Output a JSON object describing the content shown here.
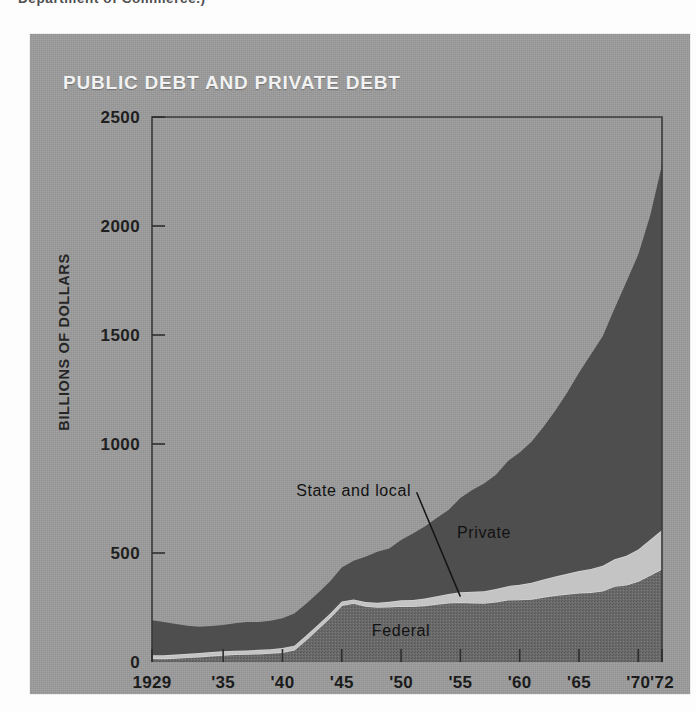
{
  "page": {
    "caption_fragment": "Department of Commerce.)",
    "background_color": "#fdfdfd",
    "panel_color": "#9c9c9c"
  },
  "chart_panel": {
    "title": "PUBLIC DEBT AND PRIVATE DEBT",
    "title_color": "#f2f2f2"
  },
  "chart_data": {
    "type": "area",
    "stacked": true,
    "title": "PUBLIC DEBT AND PRIVATE DEBT",
    "xlabel": "",
    "ylabel": "BILLIONS OF DOLLARS",
    "ylim": [
      0,
      2500
    ],
    "xlim": [
      1929,
      1972
    ],
    "grid": false,
    "legend": "inline-annotations",
    "ytick_labels": [
      "0",
      "500",
      "1000",
      "1500",
      "2000",
      "2500"
    ],
    "yticks": [
      0,
      500,
      1000,
      1500,
      2000,
      2500
    ],
    "xtick_labels": [
      "1929",
      "'35",
      "'40",
      "'45",
      "'50",
      "'55",
      "'60",
      "'65",
      "'70",
      "'72"
    ],
    "xticks": [
      1929,
      1935,
      1940,
      1945,
      1950,
      1955,
      1960,
      1965,
      1970,
      1972
    ],
    "x": [
      1929,
      1930,
      1931,
      1932,
      1933,
      1934,
      1935,
      1936,
      1937,
      1938,
      1939,
      1940,
      1941,
      1942,
      1943,
      1944,
      1945,
      1946,
      1947,
      1948,
      1949,
      1950,
      1951,
      1952,
      1953,
      1954,
      1955,
      1956,
      1957,
      1958,
      1959,
      1960,
      1961,
      1962,
      1963,
      1964,
      1965,
      1966,
      1967,
      1968,
      1969,
      1970,
      1971,
      1972
    ],
    "series": [
      {
        "name": "Federal",
        "color": "#6a6a6a",
        "texture": "stipple",
        "values": [
          17,
          16,
          18,
          21,
          24,
          29,
          32,
          35,
          36,
          38,
          41,
          45,
          56,
          102,
          153,
          203,
          260,
          270,
          257,
          252,
          253,
          257,
          255,
          259,
          266,
          271,
          274,
          272,
          270,
          276,
          285,
          286,
          289,
          298,
          306,
          312,
          317,
          320,
          327,
          348,
          354,
          371,
          398,
          427
        ]
      },
      {
        "name": "State and local",
        "color": "#c4c4c4",
        "values": [
          14,
          15,
          16,
          17,
          17,
          17,
          17,
          17,
          17,
          18,
          18,
          19,
          19,
          19,
          18,
          18,
          17,
          17,
          18,
          20,
          23,
          26,
          29,
          32,
          36,
          41,
          46,
          50,
          54,
          59,
          63,
          68,
          74,
          80,
          86,
          93,
          100,
          107,
          114,
          123,
          133,
          145,
          163,
          178
        ]
      },
      {
        "name": "Private",
        "color": "#4e4e4e",
        "values": [
          161,
          153,
          140,
          128,
          121,
          119,
          121,
          126,
          131,
          127,
          130,
          137,
          147,
          146,
          145,
          148,
          156,
          178,
          208,
          234,
          245,
          277,
          305,
          331,
          358,
          385,
          432,
          467,
          495,
          524,
          573,
          607,
          647,
          700,
          761,
          830,
          910,
          983,
          1053,
          1150,
          1257,
          1353,
          1486,
          1675
        ]
      }
    ],
    "annotations": [
      {
        "text": "State and local",
        "x": 1946,
        "y": 760,
        "leader_to": {
          "x": 1955,
          "y": 300
        }
      },
      {
        "text": "Private",
        "x": 1957,
        "y": 570
      },
      {
        "text": "Federal",
        "x": 1950,
        "y": 120
      }
    ]
  }
}
